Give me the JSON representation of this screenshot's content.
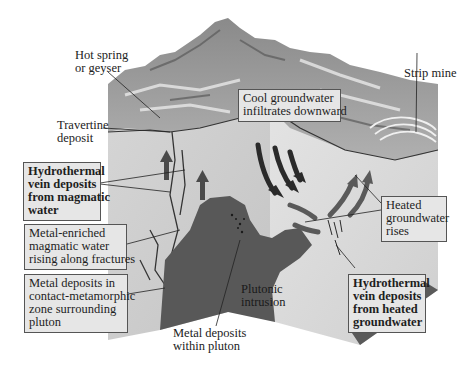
{
  "diagram": {
    "type": "geologic-block-diagram",
    "colors": {
      "background": "#ffffff",
      "label_box_fill": "#e6e6e6",
      "label_box_border": "#555555",
      "pluton": "#555555",
      "host_rock": "#d8d8d8",
      "surface_terrain": "#a8a8a8",
      "arrow_dark": "#2a2a2a",
      "arrow_medium": "#5a5a5a"
    },
    "labels": {
      "hot_spring": [
        "Hot spring",
        "or geyser"
      ],
      "travertine": [
        "Travertine",
        "deposit"
      ],
      "cool_groundwater": [
        "Cool groundwater",
        "infiltrates downward"
      ],
      "strip_mine": [
        "Strip mine"
      ],
      "vein_magmatic": [
        "Hydrothermal",
        "vein deposits",
        "from magmatic",
        "water"
      ],
      "metal_enriched": [
        "Metal-enriched",
        "magmatic water",
        "rising along fractures"
      ],
      "contact_metamorphic": [
        "Metal deposits in",
        "contact-metamorphic",
        "zone surrounding",
        "pluton"
      ],
      "plutonic_intrusion": [
        "Plutonic",
        "intrusion"
      ],
      "metal_within_pluton": [
        "Metal deposits",
        "within pluton"
      ],
      "heated_groundwater": [
        "Heated",
        "groundwater",
        "rises"
      ],
      "vein_heated": [
        "Hydrothermal",
        "vein deposits",
        "from heated",
        "groundwater"
      ]
    },
    "flow_arrows": {
      "downward_cool": 3,
      "rising_heated": 2,
      "rising_magmatic": 2
    }
  }
}
